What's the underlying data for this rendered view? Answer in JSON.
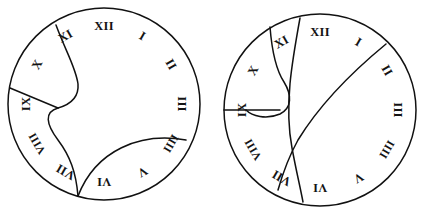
{
  "figure": {
    "title": "",
    "background_color": "#ffffff",
    "stroke_color": "#111111",
    "numeral_color": "#141414"
  },
  "dials": [
    {
      "id": "left-dial",
      "name": "left-clock-face",
      "center": {
        "x": 104,
        "y": 104
      },
      "radius": 96,
      "hours": [
        {
          "label": "XII",
          "hour": 12,
          "angle_deg": 0,
          "tx": 104,
          "ty": 27,
          "rot": 0
        },
        {
          "label": "I",
          "hour": 1,
          "angle_deg": 30,
          "tx": 142,
          "ty": 37,
          "rot": 30
        },
        {
          "label": "II",
          "hour": 2,
          "angle_deg": 60,
          "tx": 170,
          "ty": 65,
          "rot": 60
        },
        {
          "label": "III",
          "hour": 3,
          "angle_deg": 90,
          "tx": 181,
          "ty": 104,
          "rot": 90
        },
        {
          "label": "IIII",
          "hour": 4,
          "angle_deg": 120,
          "tx": 170,
          "ty": 143,
          "rot": 120
        },
        {
          "label": "V",
          "hour": 5,
          "angle_deg": 150,
          "tx": 142,
          "ty": 171,
          "rot": 150
        },
        {
          "label": "VI",
          "hour": 6,
          "angle_deg": 180,
          "tx": 104,
          "ty": 181,
          "rot": 180
        },
        {
          "label": "VII",
          "hour": 7,
          "angle_deg": 210,
          "tx": 66,
          "ty": 171,
          "rot": 210
        },
        {
          "label": "VIII",
          "hour": 8,
          "angle_deg": 240,
          "tx": 38,
          "ty": 143,
          "rot": 240
        },
        {
          "label": "IX",
          "hour": 9,
          "angle_deg": 270,
          "tx": 27,
          "ty": 104,
          "rot": 270
        },
        {
          "label": "X",
          "hour": 10,
          "angle_deg": 300,
          "tx": 38,
          "ty": 65,
          "rot": 300
        },
        {
          "label": "XI",
          "hour": 11,
          "angle_deg": 330,
          "tx": 66,
          "ty": 37,
          "rot": 330
        }
      ],
      "curves": [
        {
          "name": "xi-lobe-curve",
          "d": "M 56,25 C 66,52 76,68 78,84 C 79,96 72,104 58,108"
        },
        {
          "name": "s-curve-to-vii",
          "d": "M 58,108 C 44,112 46,124 58,140 C 70,156 76,172 78,196"
        },
        {
          "name": "ix-x-radial-line",
          "d": "M 10,88 L 58,108"
        },
        {
          "name": "lower-arc-to-iiii",
          "d": "M 78,196 C 96,150 140,132 186,140"
        }
      ]
    },
    {
      "id": "right-dial",
      "name": "right-clock-face",
      "center": {
        "x": 320,
        "y": 110
      },
      "radius": 96,
      "hours": [
        {
          "label": "XII",
          "hour": 12,
          "angle_deg": 0,
          "tx": 320,
          "ty": 33,
          "rot": 0
        },
        {
          "label": "I",
          "hour": 1,
          "angle_deg": 30,
          "tx": 358,
          "ty": 43,
          "rot": 30
        },
        {
          "label": "II",
          "hour": 2,
          "angle_deg": 60,
          "tx": 386,
          "ty": 71,
          "rot": 60
        },
        {
          "label": "III",
          "hour": 3,
          "angle_deg": 90,
          "tx": 397,
          "ty": 110,
          "rot": 90
        },
        {
          "label": "IIII",
          "hour": 4,
          "angle_deg": 120,
          "tx": 386,
          "ty": 149,
          "rot": 120
        },
        {
          "label": "V",
          "hour": 5,
          "angle_deg": 150,
          "tx": 358,
          "ty": 177,
          "rot": 150
        },
        {
          "label": "VI",
          "hour": 6,
          "angle_deg": 180,
          "tx": 320,
          "ty": 187,
          "rot": 180
        },
        {
          "label": "VII",
          "hour": 7,
          "angle_deg": 210,
          "tx": 282,
          "ty": 177,
          "rot": 210
        },
        {
          "label": "VIII",
          "hour": 8,
          "angle_deg": 240,
          "tx": 254,
          "ty": 149,
          "rot": 240
        },
        {
          "label": "IX",
          "hour": 9,
          "angle_deg": 270,
          "tx": 243,
          "ty": 110,
          "rot": 270
        },
        {
          "label": "X",
          "hour": 10,
          "angle_deg": 300,
          "tx": 254,
          "ty": 71,
          "rot": 300
        },
        {
          "label": "XI",
          "hour": 11,
          "angle_deg": 330,
          "tx": 282,
          "ty": 43,
          "rot": 330
        }
      ],
      "curves": [
        {
          "name": "xii-to-vi-curve",
          "d": "M 300,18 C 292,62 284,106 292,148 C 296,170 300,186 303,202"
        },
        {
          "name": "i-to-vii-curve",
          "d": "M 386,44 C 352,72 320,104 298,140 C 288,158 282,176 278,190"
        },
        {
          "name": "xi-hook-loop",
          "d": "M 270,27 C 272,52 276,70 284,82 C 292,95 292,108 280,114 C 266,120 252,116 246,110"
        },
        {
          "name": "ix-hook-baseline",
          "d": "M 224,110 L 280,110"
        }
      ]
    }
  ]
}
